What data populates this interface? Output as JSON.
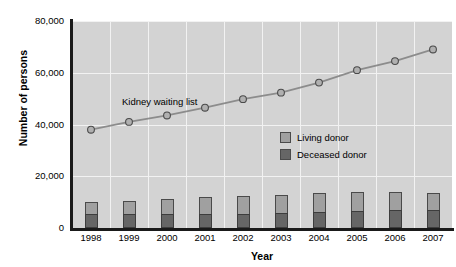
{
  "chart_data": {
    "type": "bar",
    "title": "",
    "xlabel": "Year",
    "ylabel": "Number of persons",
    "categories": [
      "1998",
      "1999",
      "2000",
      "2001",
      "2002",
      "2003",
      "2004",
      "2005",
      "2006",
      "2007"
    ],
    "ylim": [
      0,
      80000
    ],
    "yticks": [
      "0",
      "20,000",
      "40,000",
      "60,000",
      "80,000"
    ],
    "ytick_values": [
      0,
      20000,
      40000,
      60000,
      80000
    ],
    "grid": true,
    "legend_position": "inside-right",
    "annotations": [
      {
        "text": "Kidney waiting list",
        "x": "1999",
        "y": 50000
      }
    ],
    "series": [
      {
        "name": "Deceased donor",
        "type": "bar-stacked-bottom",
        "color": "#666666",
        "values": [
          5300,
          5400,
          5500,
          5500,
          5600,
          5800,
          6200,
          6700,
          7000,
          7000
        ]
      },
      {
        "name": "Living donor",
        "type": "bar-stacked-top",
        "color": "#a0a0a0",
        "values": [
          4700,
          5100,
          5800,
          6400,
          6600,
          6800,
          7200,
          7100,
          6900,
          6400
        ]
      },
      {
        "name": "Kidney waiting list",
        "type": "line",
        "color": "#8c8c8c",
        "marker": "circle",
        "values": [
          38000,
          41000,
          43500,
          46500,
          49800,
          52300,
          56200,
          61000,
          64500,
          69000
        ]
      }
    ]
  },
  "legend": {
    "items": [
      {
        "label": "Living donor",
        "color": "#a0a0a0"
      },
      {
        "label": "Deceased donor",
        "color": "#666666"
      }
    ]
  },
  "colors": {
    "plot_background": "#d3d3d3",
    "gridline": "#f2f2f2",
    "axis": "#1a1a1a",
    "living_donor": "#a0a0a0",
    "deceased_donor": "#666666",
    "line": "#8c8c8c"
  }
}
